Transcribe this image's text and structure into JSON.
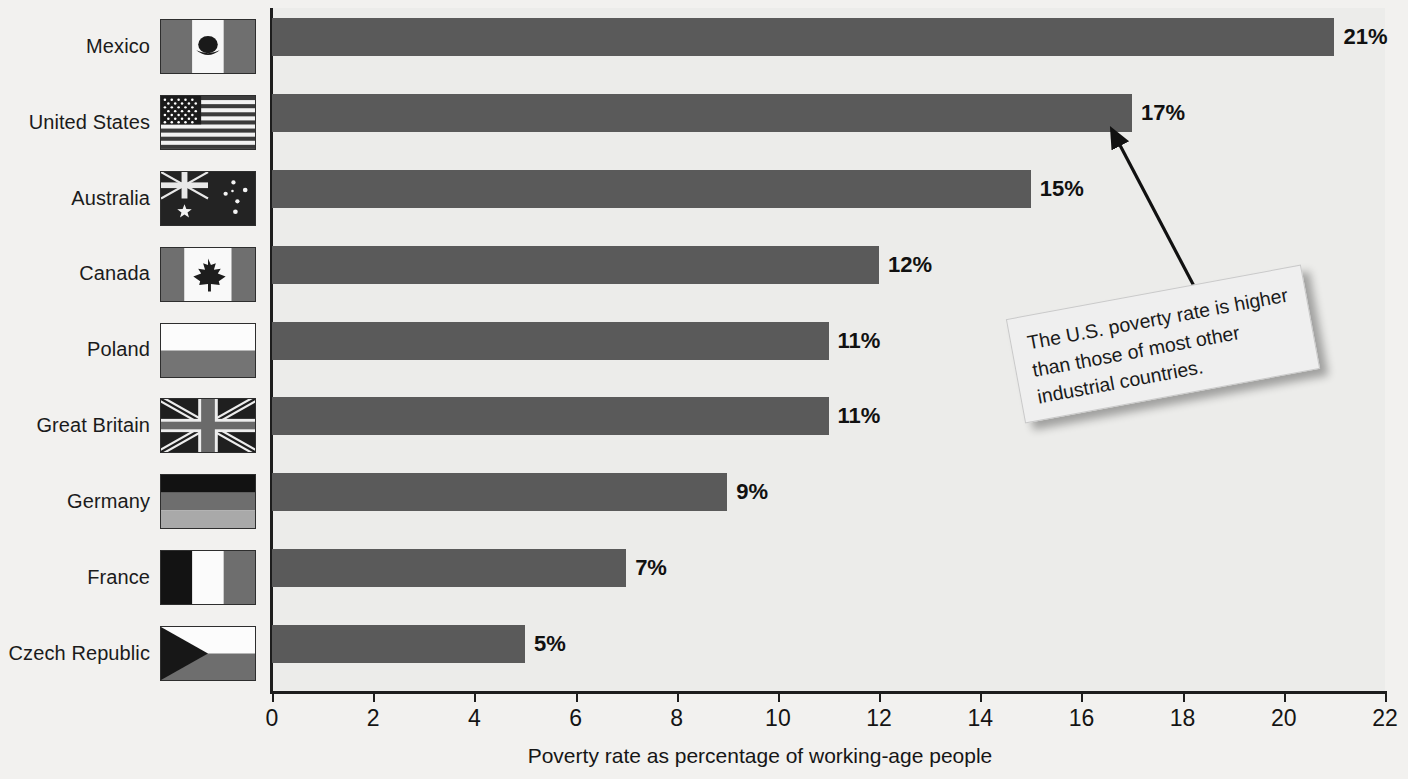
{
  "chart_data": {
    "type": "bar",
    "orientation": "horizontal",
    "title": "",
    "xlabel": "Poverty rate as percentage of working-age people",
    "ylabel": "",
    "xlim": [
      0,
      22
    ],
    "xticks": [
      0,
      2,
      4,
      6,
      8,
      10,
      12,
      14,
      16,
      18,
      20,
      22
    ],
    "grid": false,
    "legend": null,
    "categories": [
      "Mexico",
      "United States",
      "Australia",
      "Canada",
      "Poland",
      "Great Britain",
      "Germany",
      "France",
      "Czech Republic"
    ],
    "values": [
      21,
      17,
      15,
      12,
      11,
      11,
      9,
      7,
      5
    ],
    "value_labels": [
      "21%",
      "17%",
      "15%",
      "12%",
      "11%",
      "11%",
      "9%",
      "7%",
      "5%"
    ],
    "bar_color": "#5a5a5a",
    "plot_background": "#ececea",
    "annotations": [
      {
        "text": "The U.S. poverty rate is higher than those of most other industrial countries.",
        "points_to": "United States"
      }
    ]
  },
  "rows": [
    {
      "label": "Mexico",
      "flag": "mexico-flag",
      "value": 21,
      "value_label": "21%"
    },
    {
      "label": "United States",
      "flag": "united-states-flag",
      "value": 17,
      "value_label": "17%"
    },
    {
      "label": "Australia",
      "flag": "australia-flag",
      "value": 15,
      "value_label": "15%"
    },
    {
      "label": "Canada",
      "flag": "canada-flag",
      "value": 12,
      "value_label": "12%"
    },
    {
      "label": "Poland",
      "flag": "poland-flag",
      "value": 11,
      "value_label": "11%"
    },
    {
      "label": "Great Britain",
      "flag": "great-britain-flag",
      "value": 11,
      "value_label": "11%"
    },
    {
      "label": "Germany",
      "flag": "germany-flag",
      "value": 9,
      "value_label": "9%"
    },
    {
      "label": "France",
      "flag": "france-flag",
      "value": 7,
      "value_label": "7%"
    },
    {
      "label": "Czech Republic",
      "flag": "czech-republic-flag",
      "value": 5,
      "value_label": "5%"
    }
  ],
  "axis": {
    "title": "Poverty rate as percentage of working-age people",
    "ticks": [
      "0",
      "2",
      "4",
      "6",
      "8",
      "10",
      "12",
      "14",
      "16",
      "18",
      "20",
      "22"
    ]
  },
  "callout": {
    "text": "The U.S. poverty rate is higher than those of most other industrial countries."
  }
}
